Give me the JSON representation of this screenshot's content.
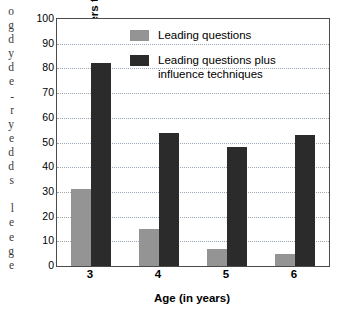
{
  "margin_text": {
    "lines": [
      "o",
      "g",
      "d",
      "y",
      "d",
      "e",
      "-",
      "r",
      "y",
      "e",
      "d",
      "d",
      "s",
      "",
      "l",
      "e",
      "e",
      "g",
      "e"
    ]
  },
  "chart_data": {
    "type": "bar",
    "title": "",
    "xlabel": "Age (in years)",
    "ylabel": "Mean percent yes answers to misleading questions",
    "categories": [
      "3",
      "4",
      "5",
      "6"
    ],
    "series": [
      {
        "name": "Leading questions",
        "color": "#949494",
        "values": [
          31,
          15,
          7,
          5
        ]
      },
      {
        "name": "Leading questions plus\ninfluence techniques",
        "color": "#2b2b2b",
        "values": [
          82,
          54,
          48,
          53
        ]
      }
    ],
    "ylim": [
      0,
      100
    ],
    "ytick_values": [
      0,
      10,
      20,
      30,
      40,
      50,
      60,
      70,
      80,
      90,
      100
    ],
    "ytick_labels": [
      "0",
      "10",
      "20",
      "30",
      "40",
      "50",
      "60",
      "70",
      "80",
      "90",
      "100"
    ],
    "grid": true,
    "grid_color": "#9aa7b4",
    "legend_position": "upper-center",
    "axis_color": "#4b4b4b",
    "background": "#ffffff"
  }
}
